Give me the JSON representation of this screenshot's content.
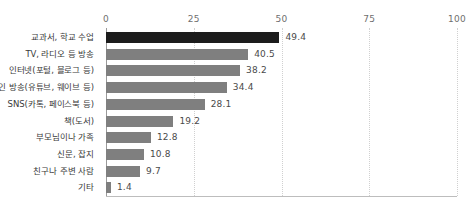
{
  "chart_data": {
    "type": "bar",
    "orientation": "horizontal",
    "title": "",
    "subtitle": "",
    "xlabel": "",
    "ylabel": "",
    "xlim": [
      0,
      100
    ],
    "xticks": [
      "0",
      "25",
      "50",
      "75",
      "100"
    ],
    "xtick_values": [
      0,
      25,
      50,
      75,
      100
    ],
    "grid": true,
    "legend": false,
    "categories": [
      "교과서, 학교 수업",
      "TV, 라디오 등 방송",
      "인터넷(포털, 블로그 등)",
      "온라인 방송(유튜브, 웨이브 등)",
      "SNS(카톡, 페이스북 등)",
      "책(도서)",
      "부모님이나 가족",
      "신문, 잡지",
      "친구나 주변 사람",
      "기타"
    ],
    "values": [
      49.4,
      40.5,
      38.2,
      34.4,
      28.1,
      19.2,
      12.8,
      10.8,
      9.7,
      1.4
    ],
    "value_labels": [
      "49.4",
      "40.5",
      "38.2",
      "34.4",
      "28.1",
      "19.2",
      "12.8",
      "10.8",
      "9.7",
      "1.4"
    ],
    "bar_colors": [
      "#1c1c1c",
      "#7f7f7f",
      "#7f7f7f",
      "#7f7f7f",
      "#7f7f7f",
      "#7f7f7f",
      "#7f7f7f",
      "#7f7f7f",
      "#7f7f7f",
      "#7f7f7f"
    ],
    "highlight_index": 0,
    "colors": {
      "highlight": "#1c1c1c",
      "bar": "#7f7f7f",
      "gridline": "#d0d0d0",
      "axis": "#9a9a9a",
      "tick_text": "#6f6f6f",
      "category_text": "#3a3a3a",
      "value_text": "#4a4a4a",
      "background": "#ffffff"
    }
  }
}
